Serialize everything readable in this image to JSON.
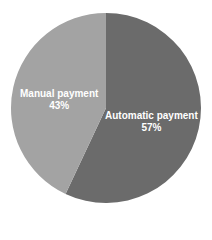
{
  "chart_data": {
    "type": "pie",
    "title": "",
    "categories": [
      "Automatic payment",
      "Manual payment"
    ],
    "values": [
      57,
      43
    ],
    "labels": [
      "57%",
      "43%"
    ],
    "colors": [
      "#6b6b6b",
      "#a3a3a3"
    ],
    "legend": "none",
    "start_angle": "12 o'clock, clockwise"
  },
  "slices": [
    {
      "name": "Automatic payment",
      "pct": "57%",
      "color": "#6b6b6b"
    },
    {
      "name": "Manual payment",
      "pct": "43%",
      "color": "#a3a3a3"
    }
  ]
}
